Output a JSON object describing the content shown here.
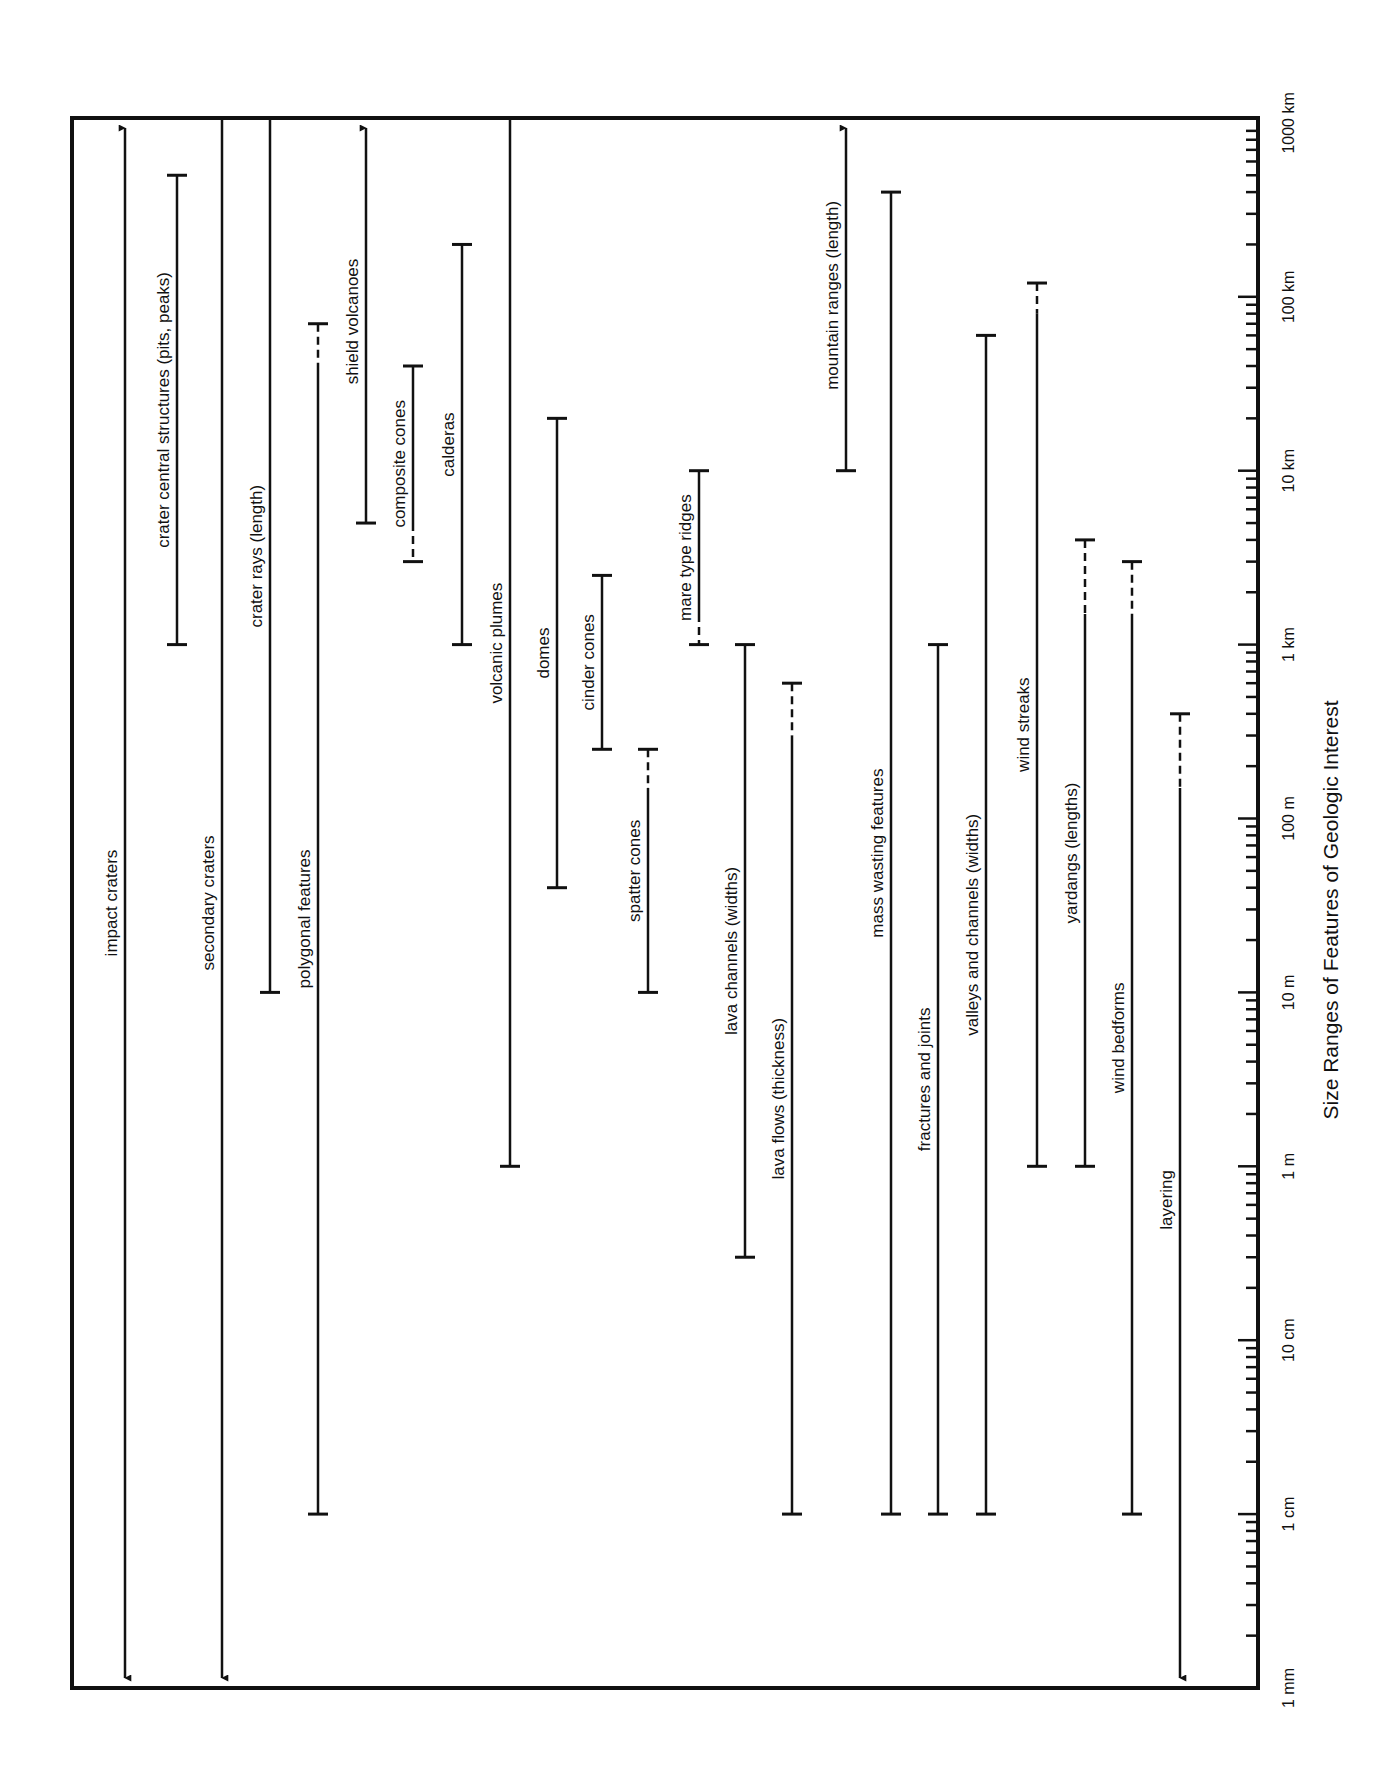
{
  "chart_data": {
    "type": "range-bar",
    "title": "Size Ranges of Features of Geologic Interest",
    "xlabel": "",
    "ylabel": "Size Ranges of Features of Geologic Interest",
    "orientation": "rotated (log size axis runs vertically, labels rotated -90°)",
    "scale": "log10",
    "axis_range_m": [
      0.001,
      1000000
    ],
    "tick_labels": [
      "1 mm",
      "1 cm",
      "10 cm",
      "1 m",
      "10 m",
      "100 m",
      "1 km",
      "10 km",
      "100 km",
      "1000 km"
    ],
    "tick_values_m": [
      0.001,
      0.01,
      0.1,
      1,
      10,
      100,
      1000,
      10000,
      100000,
      1000000
    ],
    "grid": false,
    "legend": "none",
    "series": [
      {
        "name": "impact craters",
        "min_m": 0.001,
        "max_m": 1000000,
        "min_open": true,
        "max_open": true,
        "x": 125
      },
      {
        "name": "crater central structures (pits, peaks)",
        "min_m": 1000,
        "max_m": 500000,
        "x": 177
      },
      {
        "name": "secondary craters",
        "min_m": 0.001,
        "max_m": 50000,
        "min_open": true,
        "max_plain": true,
        "x": 222
      },
      {
        "name": "crater rays (length)",
        "min_m": 10,
        "max_m": 1000000,
        "max_plain": true,
        "x": 270
      },
      {
        "name": "polygonal features",
        "min_m": 0.01,
        "max_m": 70000,
        "dashed_top_m": 40000,
        "x": 318
      },
      {
        "name": "shield volcanoes",
        "min_m": 5000,
        "max_m": 1000000,
        "max_open": true,
        "x": 366
      },
      {
        "name": "composite cones",
        "min_m": 3000,
        "max_m": 40000,
        "dashed_bottom_m": 5000,
        "x": 413
      },
      {
        "name": "calderas",
        "min_m": 1000,
        "max_m": 200000,
        "x": 462
      },
      {
        "name": "volcanic plumes",
        "min_m": 1,
        "max_m": 1000000,
        "max_plain": true,
        "x": 510
      },
      {
        "name": "domes",
        "min_m": 40,
        "max_m": 20000,
        "x": 557
      },
      {
        "name": "cinder cones",
        "min_m": 250,
        "max_m": 2500,
        "x": 602
      },
      {
        "name": "spatter cones",
        "min_m": 10,
        "max_m": 250,
        "dashed_top_m": 150,
        "x": 648
      },
      {
        "name": "mare type ridges",
        "min_m": 1000,
        "max_m": 10000,
        "dashed_bottom_m": 1500,
        "x": 699
      },
      {
        "name": "lava channels (widths)",
        "min_m": 0.3,
        "max_m": 1000,
        "x": 745
      },
      {
        "name": "lava flows (thickness)",
        "min_m": 0.01,
        "max_m": 600,
        "dashed_top_m": 300,
        "x": 792
      },
      {
        "name": "mountain ranges (length)",
        "min_m": 10000,
        "max_m": 1000000,
        "max_open": true,
        "x": 846
      },
      {
        "name": "mass wasting features",
        "min_m": 0.01,
        "max_m": 400000,
        "x": 891
      },
      {
        "name": "fractures and joints",
        "min_m": 0.01,
        "max_m": 1000,
        "x": 938
      },
      {
        "name": "valleys and channels (widths)",
        "min_m": 0.01,
        "max_m": 60000,
        "x": 986
      },
      {
        "name": "wind streaks",
        "min_m": 1,
        "max_m": 120000,
        "dashed_top_m": 80000,
        "x": 1037
      },
      {
        "name": "yardangs (lengths)",
        "min_m": 1,
        "max_m": 4000,
        "dashed_top_m": 1500,
        "x": 1085
      },
      {
        "name": "wind bedforms",
        "min_m": 0.01,
        "max_m": 3000,
        "dashed_top_m": 1500,
        "x": 1132
      },
      {
        "name": "layering",
        "min_m": 0.001,
        "max_m": 400,
        "min_open": true,
        "dashed_top_m": 150,
        "x": 1180
      }
    ]
  },
  "frame": {
    "left": 72,
    "top": 118,
    "right": 1258,
    "bottom": 1688
  },
  "axis": {
    "y_1mm": 1688,
    "px_per_decade": 173.9
  }
}
